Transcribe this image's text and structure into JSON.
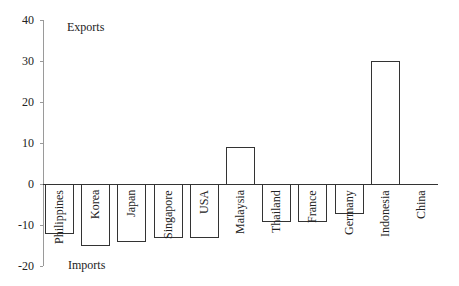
{
  "chart_data": {
    "type": "bar",
    "title": "",
    "xlabel": "",
    "ylabel": "",
    "ylim": [
      -20,
      40
    ],
    "yticks": [
      40,
      30,
      20,
      10,
      0,
      -10,
      -20
    ],
    "grid": false,
    "legend": null,
    "annotations": {
      "top": "Exports",
      "bottom": "Imports"
    },
    "categories": [
      "Philippines",
      "Korea",
      "Japan",
      "Singapore",
      "USA",
      "Malaysia",
      "Thailand",
      "France",
      "Germany",
      "Indonesia",
      "China"
    ],
    "values": [
      -12,
      -15,
      -14,
      -13,
      -13,
      9,
      -9,
      -9,
      -7,
      30,
      0
    ],
    "bar_fill": "#ffffff",
    "bar_edge": "#333333"
  }
}
